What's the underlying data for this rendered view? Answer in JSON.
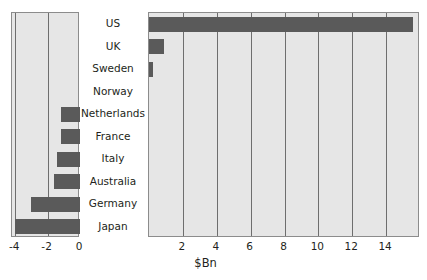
{
  "chart_data": {
    "type": "bar",
    "orientation": "horizontal",
    "title": "",
    "subtitle": "",
    "xlabel": "$Bn",
    "ylabel": "",
    "grid": true,
    "legend": null,
    "categories": [
      "US",
      "UK",
      "Sweden",
      "Norway",
      "Netherlands",
      "France",
      "Italy",
      "Australia",
      "Germany",
      "Japan"
    ],
    "panels": [
      {
        "name": "negative-panel",
        "xlim": [
          -4.2,
          0
        ],
        "xticks": [
          -4,
          -2,
          0
        ],
        "xticklabels": [
          "-4",
          "-2",
          "0"
        ],
        "values": [
          0,
          0,
          0,
          0,
          -1.2,
          -1.2,
          -1.4,
          -1.6,
          -3.0,
          -4.0
        ]
      },
      {
        "name": "positive-panel",
        "xlim": [
          0,
          16
        ],
        "xticks": [
          2,
          4,
          6,
          8,
          10,
          12,
          14
        ],
        "xticklabels": [
          "2",
          "4",
          "6",
          "8",
          "10",
          "12",
          "14"
        ],
        "values": [
          15.6,
          0.9,
          0.25,
          0,
          0,
          0,
          0,
          0,
          0,
          0
        ]
      }
    ],
    "series": [
      {
        "name": "$Bn",
        "values": [
          15.6,
          0.9,
          0.25,
          0,
          -1.2,
          -1.2,
          -1.4,
          -1.6,
          -3.0,
          -4.0
        ]
      }
    ],
    "colors": {
      "bar": "#5a5a5a",
      "panel_background": "#e6e6e6",
      "gridline": "#6e6e6e",
      "frame": "#8c8c8c",
      "text": "#231f20",
      "page_background": "#ffffff"
    }
  }
}
